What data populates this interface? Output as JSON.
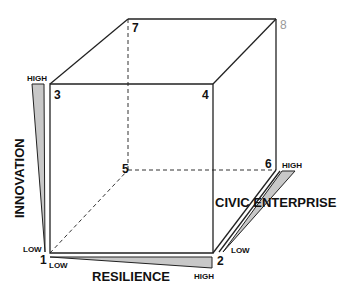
{
  "diagram": {
    "vertices": [
      "1",
      "2",
      "3",
      "4",
      "5",
      "6",
      "7",
      "8"
    ],
    "axes": {
      "innovation": {
        "label": "INNOVATION",
        "low": "LOW",
        "high": "HIGH"
      },
      "resilience": {
        "label": "RESILIENCE",
        "low": "LOW",
        "high": "HIGH"
      },
      "civic_enterprise": {
        "label": "CIVIC ENTERPRISE",
        "low": "LOW",
        "high": "HIGH"
      }
    },
    "colors": {
      "wedge_fill": "#c8c8c8",
      "line": "#222222",
      "vertex8": "#999999"
    }
  }
}
